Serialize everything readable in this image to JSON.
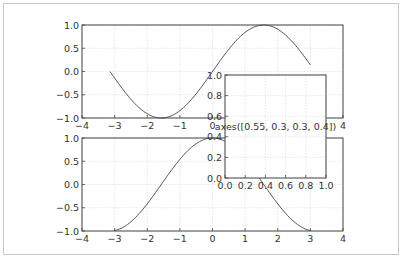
{
  "chart_data": [
    {
      "name": "top-axes",
      "type": "line",
      "function": "sin(x)",
      "x_range": [
        -3.14159,
        3.0
      ],
      "xlim": [
        -4,
        4
      ],
      "ylim": [
        -1.0,
        1.0
      ],
      "xticks": [
        "−4",
        "−3",
        "−2",
        "−1",
        "0",
        "1",
        "2",
        "3",
        "4"
      ],
      "yticks": [
        "1.0",
        "0.5",
        "0.0",
        "−0.5",
        "−1.0"
      ],
      "grid": true,
      "line_color": "#555555"
    },
    {
      "name": "bottom-axes",
      "type": "line",
      "function": "cos(x)",
      "x_range": [
        -3.0,
        3.0
      ],
      "xlim": [
        -4,
        4
      ],
      "ylim": [
        -1.0,
        1.0
      ],
      "xticks": [
        "−4",
        "−3",
        "−2",
        "−1",
        "0",
        "1",
        "2",
        "3",
        "4"
      ],
      "yticks": [
        "1.0",
        "0.5",
        "0.0",
        "−0.5",
        "−1.0"
      ],
      "grid": true,
      "line_color": "#555555"
    },
    {
      "name": "inset-axes",
      "type": "line",
      "xlim": [
        0.0,
        1.0
      ],
      "ylim": [
        0.0,
        1.0
      ],
      "xticks": [
        "0.0",
        "0.2",
        "0.4",
        "0.6",
        "0.8",
        "1.0"
      ],
      "yticks": [
        "1.0",
        "0.8",
        "0.6",
        "0.4",
        "0.2",
        "0.0"
      ],
      "grid": true,
      "annotation": "axes([0.55, 0.3, 0.3, 0.4])"
    }
  ],
  "colors": {
    "axis": "#444444",
    "grid": "#dddddd",
    "line": "#555555",
    "frame": "#c8c8c8"
  }
}
